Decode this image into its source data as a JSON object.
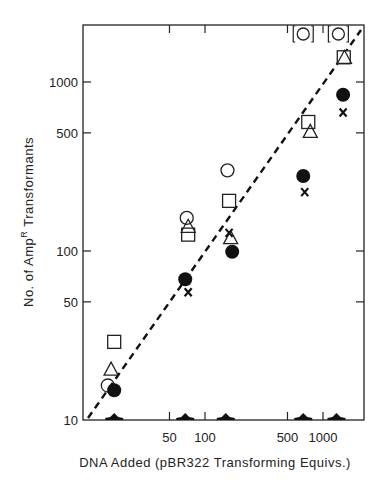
{
  "chart_data": {
    "type": "scatter",
    "title": "",
    "xlabel": "DNA Added (pBR322 Transforming Equivs.)",
    "ylabel": "No. of Amp",
    "ylabel_superscript": "R",
    "ylabel_suffix": " Transformants",
    "xscale": "log",
    "yscale": "log",
    "xlim": [
      11,
      1900
    ],
    "ylim": [
      10,
      2100
    ],
    "x_ticks": [
      50,
      100,
      500,
      1000
    ],
    "x_tick_labels": [
      "50",
      "100",
      "500",
      "1000"
    ],
    "y_ticks": [
      10,
      50,
      100,
      500,
      1000
    ],
    "y_tick_labels": [
      "10",
      "50",
      "100",
      "500",
      "1000"
    ],
    "grid": false,
    "legend": null,
    "series": [
      {
        "name": "open-square",
        "marker": "square-open",
        "x": [
          17,
          72,
          160,
          750,
          1500
        ],
        "y": [
          29,
          125,
          198,
          580,
          1400
        ]
      },
      {
        "name": "open-triangle",
        "marker": "triangle-open",
        "x": [
          16,
          72,
          165,
          780,
          1520
        ],
        "y": [
          20,
          140,
          120,
          510,
          1400
        ]
      },
      {
        "name": "open-circle",
        "marker": "circle-open",
        "x": [
          15,
          70,
          155,
          680,
          1350
        ],
        "y": [
          16,
          157,
          300,
          ">2000",
          ">2000"
        ],
        "note": "Values at 680 and 1350 plotted in brackets at top edge (off-scale)"
      },
      {
        "name": "filled-circle",
        "marker": "circle-filled",
        "x": [
          17,
          68,
          170,
          680,
          1480
        ],
        "y": [
          15,
          68,
          99,
          278,
          840
        ]
      },
      {
        "name": "cross",
        "marker": "x",
        "x": [
          72,
          160,
          700,
          1480
        ],
        "y": [
          57,
          128,
          223,
          660
        ]
      },
      {
        "name": "filled-triangle",
        "marker": "triangle-filled",
        "x": [
          17,
          68,
          150,
          680,
          1300
        ],
        "y": [
          10,
          10,
          10,
          10,
          10
        ],
        "note": "At or below detection baseline"
      }
    ],
    "fit_line": {
      "style": "dashed",
      "x": [
        11,
        1900
      ],
      "y": [
        10,
        2100
      ]
    },
    "offscale_markers": [
      {
        "x": 680,
        "label": "[O]"
      },
      {
        "x": 1350,
        "label": "[O]"
      }
    ]
  }
}
